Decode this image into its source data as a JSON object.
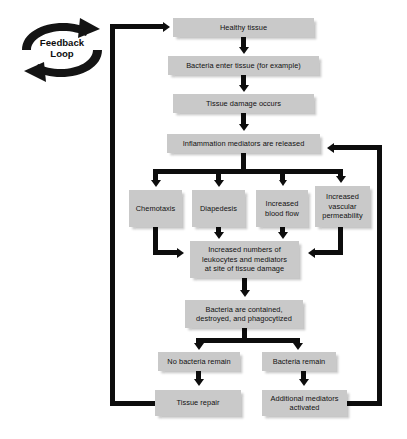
{
  "diagram": {
    "feedback": {
      "label": "Feedback\nLoop",
      "icon": "circular-arrow-loop-icon"
    },
    "colors": {
      "box_fill": "#c9c9c9",
      "line": "#0d0d0d",
      "text": "#111111",
      "background": "#ffffff"
    },
    "nodes": [
      {
        "id": "healthy-tissue",
        "label": "Healthy tissue",
        "x": 173,
        "y": 18,
        "w": 141,
        "h": 19
      },
      {
        "id": "bacteria-enter",
        "label": "Bacteria enter tissue (for example)",
        "x": 168,
        "y": 56,
        "w": 151,
        "h": 19
      },
      {
        "id": "tissue-damage",
        "label": "Tissue damage occurs",
        "x": 173,
        "y": 94,
        "w": 141,
        "h": 19
      },
      {
        "id": "mediators-released",
        "label": "Inflammation mediators are released",
        "x": 167,
        "y": 134,
        "w": 153,
        "h": 19
      },
      {
        "id": "chemotaxis",
        "label": "Chemotaxis",
        "x": 129,
        "y": 190,
        "w": 53,
        "h": 37
      },
      {
        "id": "diapedesis",
        "label": "Diapedesis",
        "x": 192,
        "y": 190,
        "w": 53,
        "h": 37
      },
      {
        "id": "increased-blood-flow",
        "label": "Increased\nblood flow",
        "x": 256,
        "y": 190,
        "w": 52,
        "h": 37
      },
      {
        "id": "vascular-permeability",
        "label": "Increased\nvascular\npermeability",
        "x": 315,
        "y": 186,
        "w": 55,
        "h": 41
      },
      {
        "id": "increased-leukocytes",
        "label": "Increased numbers of\nleukocytes and mediators\nat site of tissue damage",
        "x": 190,
        "y": 241,
        "w": 109,
        "h": 37
      },
      {
        "id": "bacteria-contained",
        "label": "Bacteria are contained,\ndestroyed, and phagocytized",
        "x": 185,
        "y": 300,
        "w": 118,
        "h": 28
      },
      {
        "id": "no-bacteria-remain",
        "label": "No bacteria remain",
        "x": 158,
        "y": 352,
        "w": 82,
        "h": 19
      },
      {
        "id": "bacteria-remain",
        "label": "Bacteria remain",
        "x": 262,
        "y": 352,
        "w": 74,
        "h": 19
      },
      {
        "id": "tissue-repair",
        "label": "Tissue repair",
        "x": 155,
        "y": 390,
        "w": 86,
        "h": 26
      },
      {
        "id": "additional-mediators",
        "label": "Additional mediators\nactivated",
        "x": 262,
        "y": 390,
        "w": 85,
        "h": 26
      }
    ]
  }
}
